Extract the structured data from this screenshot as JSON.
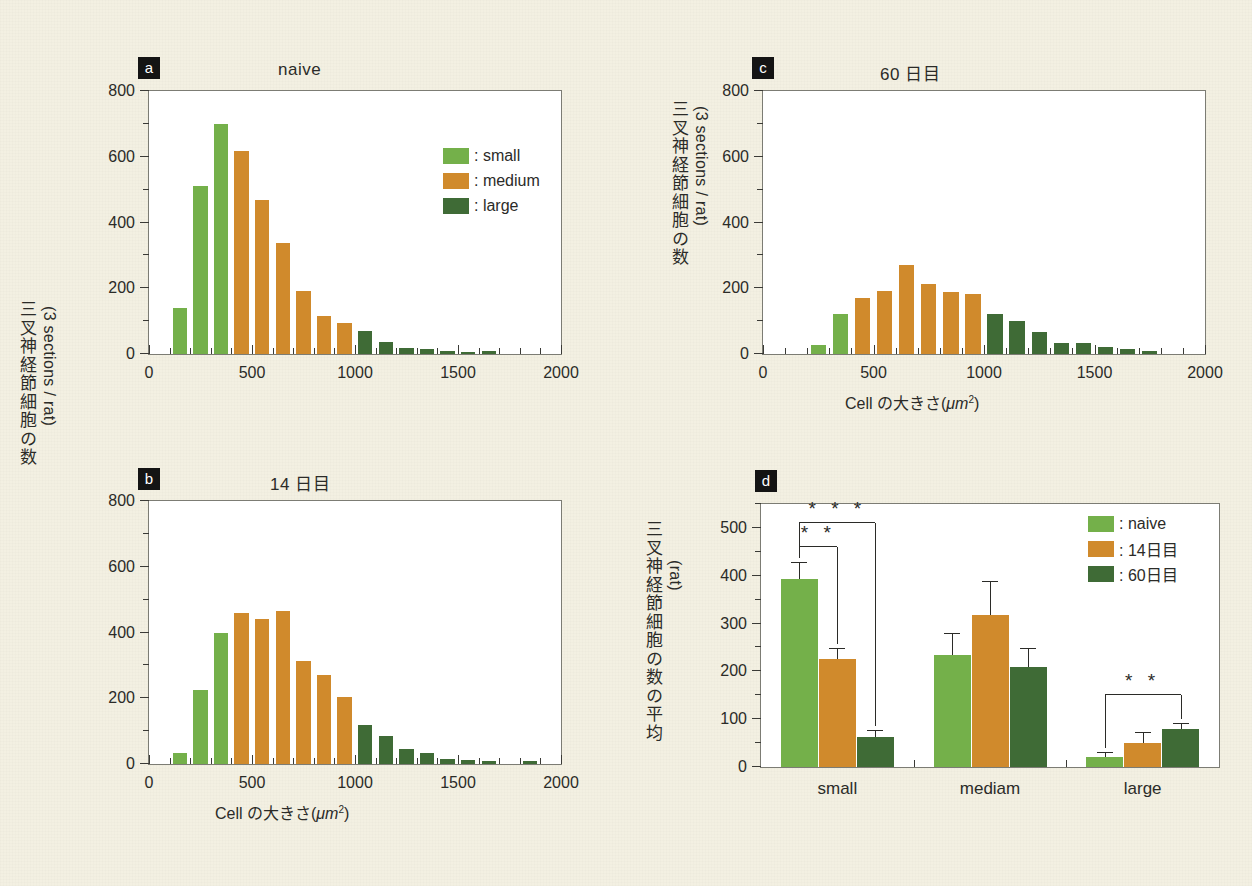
{
  "figure": {
    "background_color": "#f3f0e2",
    "colors": {
      "small": "#74b04a",
      "medium": "#d08a2c",
      "large": "#3f6b36",
      "axis": "#3a3a36",
      "plot_bg": "#ffffff",
      "tag_bg": "#141414",
      "tag_fg": "#ffffff"
    },
    "shared_y_axis_label_jp": "三叉神経節細胞の数",
    "shared_y_axis_label_unit": "(3 sections / rat)",
    "x_axis_title": "Cell の大きさ( μm2 )",
    "x_axis_title_main": "Cell の大きさ(",
    "x_axis_title_unit": "μm",
    "x_axis_title_sup": "2",
    "x_axis_title_close": ")"
  },
  "chart_data": [
    {
      "id": "a",
      "type": "bar",
      "tag": "a",
      "title": "naive",
      "xlabel": "Cell の大きさ( μm² )",
      "ylabel": "三叉神経節細胞の数 (3 sections / rat)",
      "xlim": [
        0,
        2000
      ],
      "ylim": [
        0,
        800
      ],
      "ytick_labels": [
        "0",
        "200",
        "400",
        "600",
        "800"
      ],
      "ytick_values": [
        0,
        200,
        400,
        600,
        800
      ],
      "yminor_step": 100,
      "xtick_labels": [
        "0",
        "500",
        "1000",
        "1500",
        "2000"
      ],
      "xtick_values": [
        0,
        500,
        1000,
        1500,
        2000
      ],
      "xminor_step": 100,
      "bin_width": 100,
      "legend": {
        "position": "top-right",
        "entries": [
          {
            "label": ": small",
            "color": "#74b04a"
          },
          {
            "label": ": medium",
            "color": "#d08a2c"
          },
          {
            "label": ": large",
            "color": "#3f6b36"
          }
        ]
      },
      "bins": [
        {
          "x": 150,
          "value": 140,
          "group": "small"
        },
        {
          "x": 250,
          "value": 512,
          "group": "small"
        },
        {
          "x": 350,
          "value": 700,
          "group": "small"
        },
        {
          "x": 450,
          "value": 617,
          "group": "medium"
        },
        {
          "x": 550,
          "value": 468,
          "group": "medium"
        },
        {
          "x": 650,
          "value": 337,
          "group": "medium"
        },
        {
          "x": 750,
          "value": 192,
          "group": "medium"
        },
        {
          "x": 850,
          "value": 117,
          "group": "medium"
        },
        {
          "x": 950,
          "value": 93,
          "group": "medium"
        },
        {
          "x": 1050,
          "value": 70,
          "group": "large"
        },
        {
          "x": 1150,
          "value": 37,
          "group": "large"
        },
        {
          "x": 1250,
          "value": 18,
          "group": "large"
        },
        {
          "x": 1350,
          "value": 15,
          "group": "large"
        },
        {
          "x": 1450,
          "value": 8,
          "group": "large"
        },
        {
          "x": 1550,
          "value": 7,
          "group": "large"
        },
        {
          "x": 1650,
          "value": 8,
          "group": "large"
        }
      ]
    },
    {
      "id": "b",
      "type": "bar",
      "tag": "b",
      "title": "14 日目",
      "xlabel": "Cell の大きさ( μm² )",
      "ylabel": "三叉神経節細胞の数 (3 sections / rat)",
      "xlim": [
        0,
        2000
      ],
      "ylim": [
        0,
        800
      ],
      "ytick_labels": [
        "0",
        "200",
        "400",
        "600",
        "800"
      ],
      "ytick_values": [
        0,
        200,
        400,
        600,
        800
      ],
      "yminor_step": 100,
      "xtick_labels": [
        "0",
        "500",
        "1000",
        "1500",
        "2000"
      ],
      "xtick_values": [
        0,
        500,
        1000,
        1500,
        2000
      ],
      "xminor_step": 100,
      "bin_width": 100,
      "bins": [
        {
          "x": 150,
          "value": 32,
          "group": "small"
        },
        {
          "x": 250,
          "value": 226,
          "group": "small"
        },
        {
          "x": 350,
          "value": 400,
          "group": "small"
        },
        {
          "x": 450,
          "value": 458,
          "group": "medium"
        },
        {
          "x": 550,
          "value": 440,
          "group": "medium"
        },
        {
          "x": 650,
          "value": 466,
          "group": "medium"
        },
        {
          "x": 750,
          "value": 312,
          "group": "medium"
        },
        {
          "x": 850,
          "value": 272,
          "group": "medium"
        },
        {
          "x": 950,
          "value": 204,
          "group": "medium"
        },
        {
          "x": 1050,
          "value": 118,
          "group": "large"
        },
        {
          "x": 1150,
          "value": 84,
          "group": "large"
        },
        {
          "x": 1250,
          "value": 45,
          "group": "large"
        },
        {
          "x": 1350,
          "value": 35,
          "group": "large"
        },
        {
          "x": 1450,
          "value": 16,
          "group": "large"
        },
        {
          "x": 1550,
          "value": 11,
          "group": "large"
        },
        {
          "x": 1650,
          "value": 8,
          "group": "large"
        },
        {
          "x": 1850,
          "value": 8,
          "group": "large"
        }
      ]
    },
    {
      "id": "c",
      "type": "bar",
      "tag": "c",
      "title": "60 日目",
      "xlabel": "Cell の大きさ( μm² )",
      "ylabel": "三叉神経節細胞の数 (3 sections / rat)",
      "xlim": [
        0,
        2000
      ],
      "ylim": [
        0,
        800
      ],
      "ytick_labels": [
        "0",
        "200",
        "400",
        "600",
        "800"
      ],
      "ytick_values": [
        0,
        200,
        400,
        600,
        800
      ],
      "yminor_step": 100,
      "xtick_labels": [
        "0",
        "500",
        "1000",
        "1500",
        "2000"
      ],
      "xtick_values": [
        0,
        500,
        1000,
        1500,
        2000
      ],
      "xminor_step": 100,
      "bin_width": 100,
      "bins": [
        {
          "x": 250,
          "value": 28,
          "group": "small"
        },
        {
          "x": 350,
          "value": 122,
          "group": "small"
        },
        {
          "x": 450,
          "value": 170,
          "group": "medium"
        },
        {
          "x": 550,
          "value": 192,
          "group": "medium"
        },
        {
          "x": 650,
          "value": 272,
          "group": "medium"
        },
        {
          "x": 750,
          "value": 213,
          "group": "medium"
        },
        {
          "x": 850,
          "value": 190,
          "group": "medium"
        },
        {
          "x": 950,
          "value": 182,
          "group": "medium"
        },
        {
          "x": 1050,
          "value": 122,
          "group": "large"
        },
        {
          "x": 1150,
          "value": 100,
          "group": "large"
        },
        {
          "x": 1250,
          "value": 66,
          "group": "large"
        },
        {
          "x": 1350,
          "value": 34,
          "group": "large"
        },
        {
          "x": 1450,
          "value": 32,
          "group": "large"
        },
        {
          "x": 1550,
          "value": 20,
          "group": "large"
        },
        {
          "x": 1650,
          "value": 16,
          "group": "large"
        },
        {
          "x": 1750,
          "value": 10,
          "group": "large"
        }
      ]
    },
    {
      "id": "d",
      "type": "bar",
      "tag": "d",
      "title": "",
      "ylabel": "三叉神経節細胞の数の平均 (rat)",
      "ylabel_jp": "三叉神経節細胞の数の平均",
      "ylabel_unit": "(rat)",
      "ylim": [
        0,
        550
      ],
      "ytick_labels": [
        "0",
        "100",
        "200",
        "300",
        "400",
        "500"
      ],
      "ytick_values": [
        0,
        100,
        200,
        300,
        400,
        500
      ],
      "yminor_step": 50,
      "categories": [
        "small",
        "mediam",
        "large"
      ],
      "legend": {
        "position": "top-right",
        "entries": [
          {
            "label": ": naive",
            "color": "#74b04a"
          },
          {
            "label": ": 14日目",
            "color": "#d08a2c"
          },
          {
            "label": ": 60日目",
            "color": "#3f6b36"
          }
        ]
      },
      "series": [
        {
          "name": "naive",
          "color": "#74b04a",
          "values": [
            394,
            234,
            20
          ],
          "errors": [
            32,
            44,
            10
          ]
        },
        {
          "name": "14日目",
          "color": "#d08a2c",
          "values": [
            225,
            318,
            51
          ],
          "errors": [
            22,
            68,
            20
          ]
        },
        {
          "name": "60日目",
          "color": "#3f6b36",
          "values": [
            62,
            209,
            80
          ],
          "errors": [
            14,
            38,
            9
          ]
        }
      ],
      "annotations": [
        {
          "text": "* *",
          "group": "small",
          "from": "naive",
          "to": "14日目",
          "level": 1
        },
        {
          "text": "* * *",
          "group": "small",
          "from": "naive",
          "to": "60日目",
          "level": 2
        },
        {
          "text": "* *",
          "group": "large",
          "from": "naive",
          "to": "60日目",
          "level": 1
        }
      ]
    }
  ]
}
